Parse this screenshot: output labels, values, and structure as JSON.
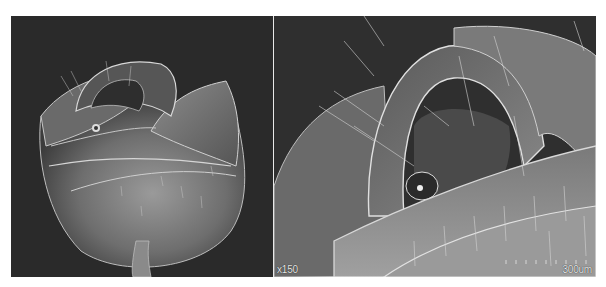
{
  "figure": {
    "panels": [
      {
        "id": "left",
        "description": "SEM micrograph of rose-shaped structure, whole view",
        "background": "#2a2a2a"
      },
      {
        "id": "right",
        "description": "SEM micrograph, magnified view of inner folds",
        "background": "#2f2f2f",
        "magnification_label": "x150",
        "scale_bar_label": "300um"
      }
    ],
    "colors": {
      "page_background": "#ffffff",
      "divider": "#e8e8e8",
      "label_text": "#e6e6e6"
    }
  }
}
